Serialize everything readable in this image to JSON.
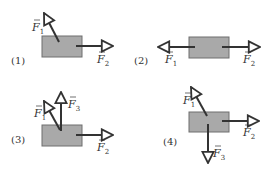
{
  "colors": {
    "box_fill": "#a9a9a9",
    "box_stroke": "#6e6e6e",
    "arrow": "#333333",
    "text": "#333333"
  },
  "panels": [
    {
      "label": "(1)",
      "forces": [
        {
          "name": "F",
          "sub": "1",
          "direction": "up-left"
        },
        {
          "name": "F",
          "sub": "2",
          "direction": "right"
        }
      ]
    },
    {
      "label": "(2)",
      "forces": [
        {
          "name": "F",
          "sub": "1",
          "direction": "left"
        },
        {
          "name": "F",
          "sub": "2",
          "direction": "right"
        }
      ]
    },
    {
      "label": "(3)",
      "forces": [
        {
          "name": "F",
          "sub": "1",
          "direction": "up-left"
        },
        {
          "name": "F",
          "sub": "2",
          "direction": "right"
        },
        {
          "name": "F",
          "sub": "3",
          "direction": "up"
        }
      ]
    },
    {
      "label": "(4)",
      "forces": [
        {
          "name": "F",
          "sub": "1",
          "direction": "up-left"
        },
        {
          "name": "F",
          "sub": "2",
          "direction": "right"
        },
        {
          "name": "F",
          "sub": "3",
          "direction": "down"
        }
      ]
    }
  ]
}
